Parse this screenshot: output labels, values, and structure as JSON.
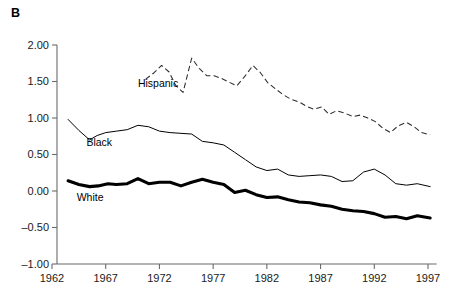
{
  "figure": {
    "panel_label": "B"
  },
  "chart_data": {
    "type": "line",
    "title": "B",
    "xlabel": "",
    "ylabel": "",
    "xlim": [
      1962,
      1997.8
    ],
    "ylim": [
      -1.0,
      2.0
    ],
    "grid": false,
    "legend": "inline-labels",
    "xticks": [
      1962,
      1967,
      1972,
      1977,
      1982,
      1987,
      1992,
      1997
    ],
    "xticklabels": [
      "1962",
      "1967",
      "1972",
      "1977",
      "1982",
      "1987",
      "1992",
      "1997"
    ],
    "yticks": [
      -1.0,
      -0.5,
      0.0,
      0.5,
      1.0,
      1.5,
      2.0
    ],
    "yticklabels": [
      "-1.00",
      "-0.50",
      "0.00",
      "0.50",
      "1.00",
      "1.50",
      "2.00"
    ],
    "series": [
      {
        "name": "Hispanic",
        "style": "dashed",
        "label_x": 1970.0,
        "label_y": 1.42,
        "x": [
          1970.7,
          1971.5,
          1972.2,
          1972.9,
          1973.5,
          1974.2,
          1975.0,
          1975.7,
          1976.4,
          1977.1,
          1977.8,
          1978.5,
          1979.2,
          1980.0,
          1980.7,
          1981.4,
          1982.1,
          1982.8,
          1983.5,
          1984.2,
          1985.0,
          1985.7,
          1986.4,
          1987.1,
          1987.8,
          1988.5,
          1989.2,
          1990.0,
          1990.7,
          1991.4,
          1992.1,
          1992.8,
          1993.5,
          1994.2,
          1995.0,
          1995.7,
          1996.4,
          1997.2
        ],
        "y": [
          1.53,
          1.62,
          1.72,
          1.63,
          1.45,
          1.35,
          1.82,
          1.68,
          1.58,
          1.58,
          1.54,
          1.49,
          1.44,
          1.58,
          1.72,
          1.62,
          1.48,
          1.4,
          1.32,
          1.26,
          1.22,
          1.16,
          1.12,
          1.15,
          1.05,
          1.1,
          1.07,
          1.02,
          1.04,
          1.0,
          0.95,
          0.86,
          0.8,
          0.89,
          0.94,
          0.88,
          0.8,
          0.77
        ]
      },
      {
        "name": "Black",
        "style": "thin-solid",
        "label_x": 1965.2,
        "label_y": 0.62,
        "x": [
          1963.5,
          1964.5,
          1965.5,
          1966.2,
          1967.0,
          1968.0,
          1969.0,
          1970.0,
          1971.0,
          1972.0,
          1973.0,
          1974.0,
          1975.0,
          1976.0,
          1977.0,
          1978.0,
          1979.0,
          1980.0,
          1981.0,
          1982.0,
          1983.0,
          1984.0,
          1985.0,
          1986.0,
          1987.0,
          1988.0,
          1989.0,
          1990.0,
          1991.0,
          1992.0,
          1993.0,
          1994.0,
          1995.0,
          1996.0,
          1997.2
        ],
        "y": [
          0.98,
          0.83,
          0.7,
          0.76,
          0.8,
          0.82,
          0.84,
          0.9,
          0.88,
          0.82,
          0.8,
          0.79,
          0.78,
          0.68,
          0.66,
          0.63,
          0.53,
          0.43,
          0.33,
          0.28,
          0.3,
          0.22,
          0.2,
          0.21,
          0.22,
          0.2,
          0.13,
          0.14,
          0.26,
          0.3,
          0.22,
          0.1,
          0.08,
          0.1,
          0.06
        ]
      },
      {
        "name": "White",
        "style": "thick-solid",
        "label_x": 1964.3,
        "label_y": -0.14,
        "x": [
          1963.5,
          1964.5,
          1965.5,
          1966.3,
          1967.2,
          1968.0,
          1969.0,
          1970.0,
          1971.0,
          1972.0,
          1973.0,
          1974.0,
          1975.0,
          1976.0,
          1977.0,
          1978.0,
          1979.0,
          1980.0,
          1981.0,
          1982.0,
          1983.0,
          1984.0,
          1985.0,
          1986.0,
          1987.0,
          1988.0,
          1989.0,
          1990.0,
          1991.0,
          1992.0,
          1993.0,
          1994.0,
          1995.0,
          1996.0,
          1997.2
        ],
        "y": [
          0.14,
          0.09,
          0.06,
          0.07,
          0.1,
          0.09,
          0.1,
          0.17,
          0.1,
          0.12,
          0.12,
          0.07,
          0.12,
          0.16,
          0.12,
          0.09,
          -0.02,
          0.01,
          -0.05,
          -0.09,
          -0.08,
          -0.12,
          -0.15,
          -0.16,
          -0.19,
          -0.21,
          -0.25,
          -0.27,
          -0.28,
          -0.31,
          -0.36,
          -0.35,
          -0.38,
          -0.34,
          -0.37
        ]
      }
    ]
  }
}
